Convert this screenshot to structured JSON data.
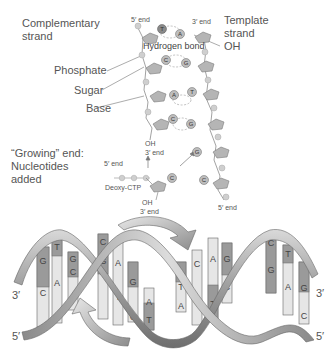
{
  "labels": {
    "complementary_strand": "Complementary\nstrand",
    "template_strand": "Template\nstrand",
    "template_oh": "OH",
    "five_end_top": "5′ end",
    "three_end_top": "3′ end",
    "hydrogen_bond": "Hydrogen bond",
    "phosphate": "Phosphate",
    "sugar": "Sugar",
    "base": "Base",
    "growing_end": "“Growing” end:\nNucleotides\nadded",
    "oh_upper": "OH",
    "three_end_upper": "3′ end",
    "five_end_incoming": "5′ end",
    "deoxy_ctp": "Deoxy-CTP",
    "oh_lower": "OH",
    "three_end_lower": "3′ end",
    "five_end_template_bottom": "5′ end",
    "helix_left_3": "3′",
    "helix_left_5": "5′",
    "helix_right_3": "3′",
    "helix_right_5": "5′"
  },
  "nucleotide_pairs": [
    {
      "complementary": "T",
      "template": "A"
    },
    {
      "complementary": "C",
      "template": "G"
    },
    {
      "complementary": "A",
      "template": "T"
    },
    {
      "complementary": "C",
      "template": "G"
    }
  ],
  "template_unpaired": [
    "G",
    "C"
  ],
  "incoming_nucleotide": "C",
  "helix_base_pairs": [
    {
      "top": "G",
      "bottom": "C"
    },
    {
      "top": "T",
      "bottom": "A"
    },
    {
      "top": "G",
      "bottom": "C"
    },
    {
      "top": "C",
      "bottom": "G"
    },
    {
      "top": "A",
      "bottom": "T"
    },
    {
      "top": "G",
      "bottom": "C"
    },
    {
      "top": "A",
      "bottom": "T"
    },
    {
      "top": "T",
      "bottom": "A"
    },
    {
      "top": "C",
      "bottom": "G"
    },
    {
      "top": "A",
      "bottom": "T"
    },
    {
      "top": "G",
      "bottom": "C"
    },
    {
      "top": "C",
      "bottom": "G"
    },
    {
      "top": "T",
      "bottom": "A"
    },
    {
      "top": "G",
      "bottom": "C"
    }
  ],
  "colors": {
    "sugar_fill": "#b5b5b5",
    "phosphate_fill": "#cfcfcf",
    "ribbon_dark": "#7a7a7a",
    "ribbon_light": "#d8d8d8",
    "base_light": "#e6e6e6",
    "base_dark": "#9a9a9a"
  }
}
